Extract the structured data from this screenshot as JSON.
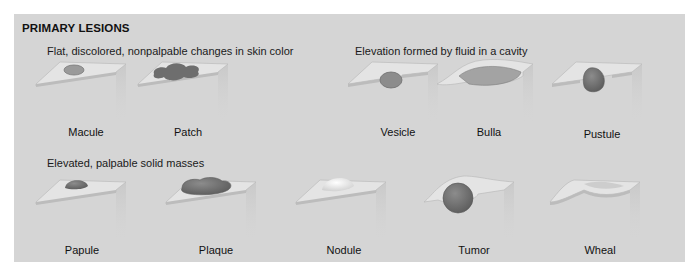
{
  "title": "PRIMARY LESIONS",
  "groups": [
    {
      "heading": "Flat, discolored, nonpalpable changes in skin color",
      "items": [
        {
          "label": "Macule"
        },
        {
          "label": "Patch"
        }
      ]
    },
    {
      "heading": "Elevation formed by fluid in a cavity",
      "items": [
        {
          "label": "Vesicle"
        },
        {
          "label": "Bulla"
        },
        {
          "label": "Pustule"
        }
      ]
    },
    {
      "heading": "Elevated, palpable solid masses",
      "items": [
        {
          "label": "Papule"
        },
        {
          "label": "Plaque"
        },
        {
          "label": "Nodule"
        },
        {
          "label": "Tumor"
        },
        {
          "label": "Wheal"
        }
      ]
    }
  ],
  "colors": {
    "panel_bg": "#d5d5d5",
    "skin_top": "#e6e6e6",
    "lesion_dark": "#6f6f6f",
    "lesion_mid": "#8a8a8a"
  }
}
